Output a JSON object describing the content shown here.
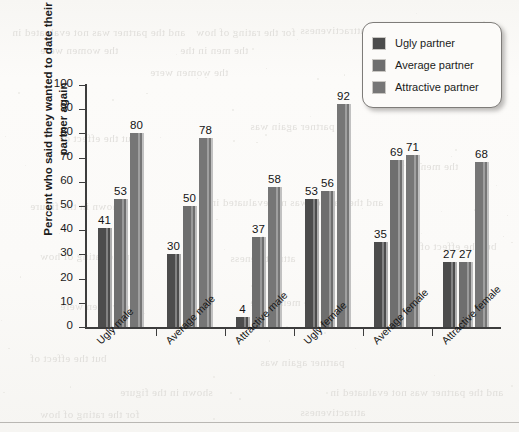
{
  "page": {
    "background_color": "#fbfaf8",
    "bleed_through_lines": [
      "and the partner was not evaluated in",
      "for the rating of how",
      "attractiveness",
      "the women were",
      "the men in the",
      "but the effect of",
      "partner again was",
      "shown in the figure"
    ]
  },
  "legend": {
    "position": "top-right",
    "items": [
      {
        "label": "Ugly partner",
        "color": "#4c4c4c",
        "swatch_name": "legend-swatch-ugly"
      },
      {
        "label": "Average partner",
        "color": "#6e6e6e",
        "swatch_name": "legend-swatch-average"
      },
      {
        "label": "Attractive partner",
        "color": "#767676",
        "swatch_name": "legend-swatch-attractive"
      }
    ]
  },
  "chart_data": {
    "type": "bar",
    "title": "",
    "subtitle": "",
    "xlabel": "",
    "ylabel": "Percent who said they wanted to date their partner again",
    "ylim": [
      0,
      100
    ],
    "yticks": [
      0,
      10,
      20,
      30,
      40,
      50,
      60,
      70,
      80,
      90,
      100
    ],
    "grid": false,
    "legend_position": "top-right",
    "categories": [
      "Ugly male",
      "Average male",
      "Attractive male",
      "Ugly female",
      "Average female",
      "Attractive female"
    ],
    "series": [
      {
        "name": "Ugly partner",
        "color": "#4c4c4c",
        "values": [
          41,
          30,
          4,
          53,
          35,
          27
        ]
      },
      {
        "name": "Average partner",
        "color": "#6e6e6e",
        "values": [
          53,
          50,
          37,
          56,
          69,
          27
        ]
      },
      {
        "name": "Attractive partner",
        "color": "#767676",
        "values": [
          80,
          78,
          58,
          92,
          71,
          68
        ]
      }
    ]
  }
}
